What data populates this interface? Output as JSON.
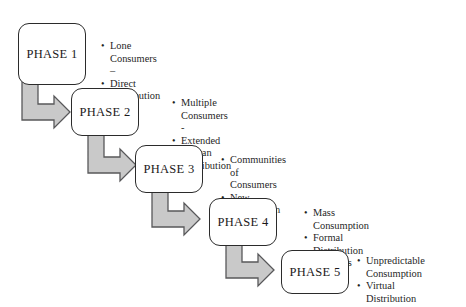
{
  "diagram": {
    "background_color": "#ffffff",
    "box_border_color": "#2b2b2b",
    "box_fill_color": "#ffffff",
    "arrow_fill_color": "#c9c9c9",
    "arrow_stroke_color": "#58585a",
    "text_color": "#1f1f1f",
    "bullet_glyph": "•"
  },
  "phases": [
    {
      "label": "PHASE 1",
      "box": {
        "x": 18,
        "y": 23,
        "w": 68,
        "h": 62
      },
      "bullets_pos": {
        "x": 101,
        "y": 40
      },
      "bullets": [
        "Lone Consumers –",
        "Direct Distribution"
      ]
    },
    {
      "label": "PHASE 2",
      "box": {
        "x": 71,
        "y": 88,
        "w": 68,
        "h": 48
      },
      "bullets_pos": {
        "x": 172,
        "y": 97
      },
      "bullets": [
        "Multiple Consumers -",
        "Extended Human  Distribution"
      ]
    },
    {
      "label": "PHASE 3",
      "box": {
        "x": 135,
        "y": 145,
        "w": 68,
        "h": 48
      },
      "bullets_pos": {
        "x": 221,
        "y": 154
      },
      "bullets": [
        "Communities of Consumers",
        "New Distribution Channels"
      ]
    },
    {
      "label": "PHASE 4",
      "box": {
        "x": 209,
        "y": 198,
        "w": 68,
        "h": 48
      },
      "bullets_pos": {
        "x": 304,
        "y": 207
      },
      "bullets": [
        "Mass Consumption",
        "Formal Distribution Channels"
      ]
    },
    {
      "label": "PHASE 5",
      "box": {
        "x": 281,
        "y": 250,
        "w": 68,
        "h": 44
      },
      "bullets_pos": {
        "x": 357,
        "y": 255
      },
      "bullets": [
        "Unpredictable\nConsumption",
        "Virtual Distribution"
      ]
    }
  ],
  "connectors": [
    {
      "name": "arrow-phase1-to-phase2",
      "from": "PHASE 1",
      "to": "PHASE 2",
      "shape": "elbow-down-right"
    },
    {
      "name": "arrow-phase2-to-phase3",
      "from": "PHASE 2",
      "to": "PHASE 3",
      "shape": "elbow-down-right"
    },
    {
      "name": "arrow-phase3-to-phase4",
      "from": "PHASE 3",
      "to": "PHASE 4",
      "shape": "elbow-down-right"
    },
    {
      "name": "arrow-phase4-to-phase5",
      "from": "PHASE 4",
      "to": "PHASE 5",
      "shape": "elbow-down-right"
    }
  ]
}
